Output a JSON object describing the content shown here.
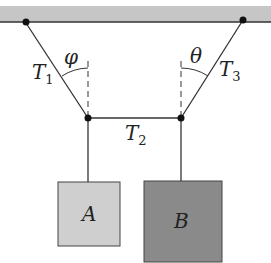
{
  "diagram": {
    "type": "physics-free-body",
    "ceiling_color": "#c4c4c4",
    "labels": {
      "t1": {
        "main": "T",
        "sub": "1"
      },
      "t2": {
        "main": "T",
        "sub": "2"
      },
      "t3": {
        "main": "T",
        "sub": "3"
      },
      "phi": "φ",
      "theta": "θ",
      "block_a": "A",
      "block_b": "B"
    },
    "colors": {
      "block_a": "#cfcfcf",
      "block_b": "#8a8a8a",
      "line": "#333333"
    }
  }
}
